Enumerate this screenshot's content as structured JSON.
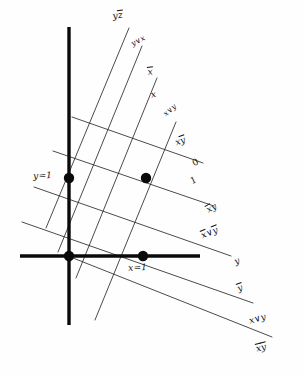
{
  "figure": {
    "background_color": "#fefefe",
    "ink_color": "#111111"
  },
  "axes": {
    "vertical": {
      "name": "vertical-axis",
      "x": 69,
      "y1": 27,
      "y2": 325,
      "stroke_width": 3.4
    },
    "horizontal": {
      "name": "horizontal-axis",
      "y": 256,
      "x1": 20,
      "x2": 200,
      "stroke_width": 3.4
    }
  },
  "points": [
    {
      "name": "point-y-equals-1",
      "x": 69,
      "y": 178,
      "r": 5.2
    },
    {
      "name": "point-interior",
      "x": 146,
      "y": 178,
      "r": 5.2
    },
    {
      "name": "point-origin",
      "x": 69,
      "y": 256,
      "r": 5.2
    },
    {
      "name": "point-x-equals-1",
      "x": 143,
      "y": 256,
      "r": 5.2
    }
  ],
  "steep_lines": [
    {
      "name": "steep-line-1",
      "x1": 129,
      "y1": 28,
      "x2": 46,
      "y2": 228
    },
    {
      "name": "steep-line-2",
      "x1": 142,
      "y1": 46,
      "x2": 58,
      "y2": 252
    },
    {
      "name": "steep-line-3",
      "x1": 157,
      "y1": 78,
      "x2": 76,
      "y2": 278
    },
    {
      "name": "steep-line-4",
      "x1": 176,
      "y1": 122,
      "x2": 95,
      "y2": 320
    }
  ],
  "shallow_lines": [
    {
      "name": "shallow-line-1",
      "x1": 72,
      "y1": 117,
      "x2": 203,
      "y2": 163
    },
    {
      "name": "shallow-line-2",
      "x1": 53,
      "y1": 151,
      "x2": 214,
      "y2": 206
    },
    {
      "name": "shallow-line-3",
      "x1": 34,
      "y1": 187,
      "x2": 231,
      "y2": 256
    },
    {
      "name": "shallow-line-4",
      "x1": 22,
      "y1": 222,
      "x2": 253,
      "y2": 303
    },
    {
      "name": "shallow-line-5",
      "x1": 68,
      "y1": 256,
      "x2": 272,
      "y2": 337
    }
  ],
  "labels": {
    "top": [
      {
        "name": "label-y-zbar",
        "text_parts": [
          "y",
          "z"
        ],
        "bars": [
          false,
          true
        ],
        "x": 112,
        "y": 12,
        "rotate": -8
      },
      {
        "name": "label-y-or-x",
        "text": "y∨x",
        "x": 130,
        "y": 41,
        "rotate": -28,
        "small": true
      },
      {
        "name": "label-xbar",
        "text_parts": [
          "x"
        ],
        "bars": [
          true
        ],
        "x": 147,
        "y": 68,
        "rotate": -8
      },
      {
        "name": "label-x",
        "text": "x",
        "x": 150,
        "y": 91,
        "rotate": -12
      }
    ],
    "mid": [
      {
        "name": "label-x-or-y",
        "text": "x∨y",
        "x": 162,
        "y": 112,
        "rotate": -40,
        "small": true
      },
      {
        "name": "label-x-ybar",
        "text_parts": [
          "x",
          "y"
        ],
        "bars": [
          false,
          true
        ],
        "x": 174,
        "y": 139,
        "rotate": -20
      },
      {
        "name": "label-zero",
        "text": "0",
        "x": 191,
        "y": 160,
        "rotate": -25,
        "plain": true
      },
      {
        "name": "label-one",
        "text": "1",
        "x": 189,
        "y": 178,
        "rotate": -25,
        "plain": true
      }
    ],
    "lower": [
      {
        "name": "label-xbar-y",
        "text_parts": [
          "x",
          "y"
        ],
        "bars": [
          true,
          false
        ],
        "x": 205,
        "y": 207,
        "rotate": -30
      },
      {
        "name": "label-xbar-or-ybar",
        "text_parts": [
          "x",
          "∨",
          "y"
        ],
        "bars": [
          true,
          false,
          true
        ],
        "x": 200,
        "y": 232,
        "rotate": -22
      },
      {
        "name": "label-y",
        "text": "y",
        "x": 233,
        "y": 258,
        "rotate": -20
      },
      {
        "name": "label-ybar",
        "text_parts": [
          "y"
        ],
        "bars": [
          true
        ],
        "x": 236,
        "y": 285,
        "rotate": -20
      }
    ],
    "bottom": [
      {
        "name": "label-x-or-y-bottom",
        "text": "x∨y",
        "x": 248,
        "y": 317,
        "rotate": -16
      },
      {
        "name": "label-xbar-ybar",
        "text_parts": [
          "x",
          "y"
        ],
        "bars": [
          true,
          true
        ],
        "x": 255,
        "y": 345,
        "rotate": -14
      }
    ],
    "axis": [
      {
        "name": "label-y-equals-1",
        "text": "y=1",
        "x": 33,
        "y": 172,
        "rotate": -3
      },
      {
        "name": "label-x-equals-1",
        "text": "x=1",
        "x": 128,
        "y": 264,
        "rotate": -3
      }
    ]
  }
}
